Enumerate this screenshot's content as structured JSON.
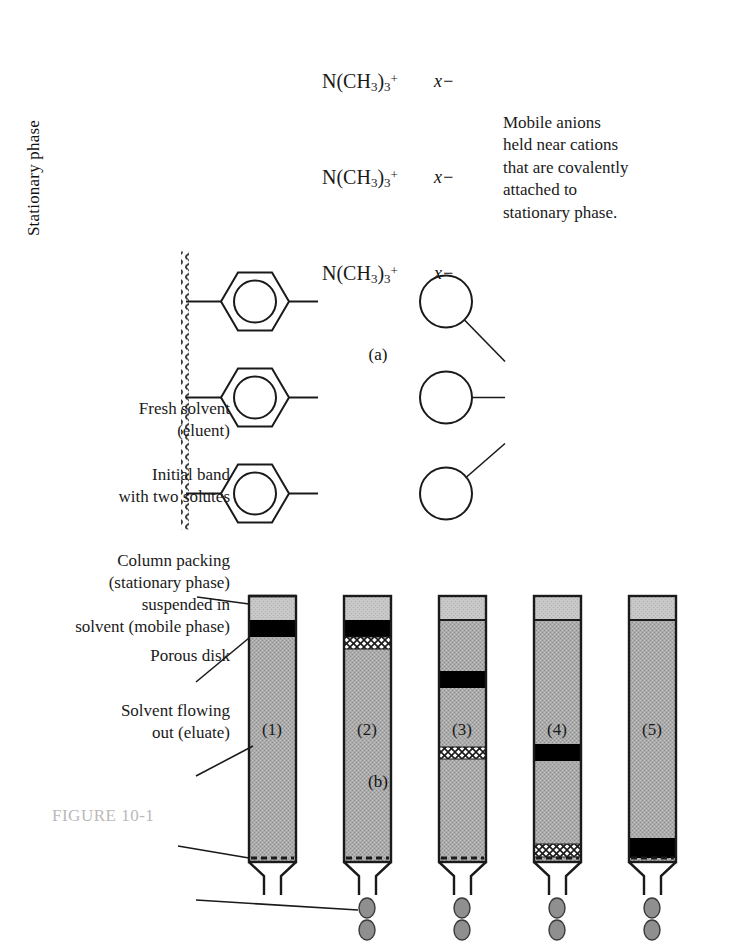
{
  "figure": {
    "panel_a_label": "(a)",
    "panel_b_label": "(b)",
    "bottom_caption": "FIGURE 10-1"
  },
  "panel_a": {
    "stationary_phase_label": "Stationary phase",
    "functional_group": "N(CH3)3+",
    "functional_group_parts": {
      "element": "N(CH",
      "sub1": "3",
      "mid": ")",
      "sub2": "3",
      "charge": "+"
    },
    "anion_label": "x−",
    "caption": "Mobile anions held near cations that are covalently attached to stationary phase.",
    "caption_lines": [
      "Mobile anions",
      "held near cations",
      "that are covalently",
      "attached to",
      "stationary phase."
    ],
    "units": 3
  },
  "panel_b": {
    "labels": {
      "fresh_solvent": "Fresh solvent\n(eluent)",
      "fresh_solvent_lines": [
        "Fresh solvent",
        "(eluent)"
      ],
      "initial_band": "Initial band with two solutes",
      "initial_band_lines": [
        "Initial band",
        "with two solutes"
      ],
      "column_packing": "Column packing (stationary phase) suspended in solvent (mobile phase)",
      "column_packing_lines": [
        "Column packing",
        "(stationary phase)",
        "suspended in",
        "solvent (mobile phase)"
      ],
      "porous_disk": "Porous disk",
      "eluate": "Solvent flowing out (eluate)",
      "eluate_lines": [
        "Solvent flowing",
        "out (eluate)"
      ]
    },
    "column_numbers": [
      "(1)",
      "(2)",
      "(3)",
      "(4)",
      "(5)"
    ],
    "columns": [
      {
        "number": "(1)",
        "solvent_top_pct": 0,
        "solvent_height_pct": 9,
        "black_band_pos_pct": 9,
        "black_band_height_pct": 6,
        "hatch_band_pos_pct": null,
        "hatch_band_height_pct": 0,
        "droplets": 0
      },
      {
        "number": "(2)",
        "solvent_top_pct": 0,
        "solvent_height_pct": 9,
        "black_band_pos_pct": 9,
        "black_band_height_pct": 6,
        "hatch_band_pos_pct": 15,
        "hatch_band_height_pct": 4,
        "droplets": 2
      },
      {
        "number": "(3)",
        "solvent_top_pct": 0,
        "solvent_height_pct": 9,
        "black_band_pos_pct": 29,
        "black_band_height_pct": 6,
        "hatch_band_pos_pct": 57,
        "hatch_band_height_pct": 4,
        "droplets": 2
      },
      {
        "number": "(4)",
        "solvent_top_pct": 0,
        "solvent_height_pct": 9,
        "black_band_pos_pct": 56,
        "black_band_height_pct": 6,
        "hatch_band_pos_pct": 92,
        "hatch_band_height_pct": 4,
        "droplets": 2
      },
      {
        "number": "(5)",
        "solvent_top_pct": 0,
        "solvent_height_pct": 9,
        "black_band_pos_pct": 90,
        "black_band_height_pct": 6,
        "hatch_band_pos_pct": null,
        "hatch_band_height_pct": 0,
        "droplets": 2
      }
    ]
  },
  "colors": {
    "packing_gray": "#a9a9a9",
    "solvent_gray": "#c6c6c6",
    "band_black": "#000000",
    "outline": "#1a1a1a",
    "droplet_gray": "#8f8f8f",
    "background": "#ffffff"
  }
}
